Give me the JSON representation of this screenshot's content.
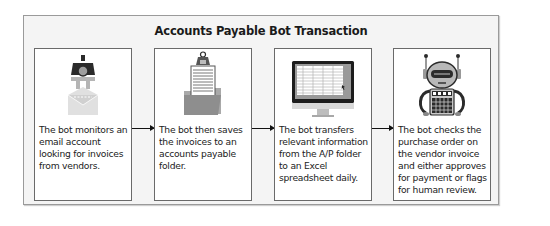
{
  "diagram": {
    "title": "Accounts Payable Bot Transaction",
    "steps": [
      {
        "icon": "robot-claw-envelope-icon",
        "text": "The bot monitors an email account looking for invoices from vendors."
      },
      {
        "icon": "clipboard-folder-icon",
        "text": "The bot then saves the invoices to an accounts payable folder."
      },
      {
        "icon": "monitor-spreadsheet-icon",
        "text": "The bot transfers relevant information from the A/P folder to an Excel spreadsheet daily."
      },
      {
        "icon": "robot-calculator-icon",
        "text": "The bot checks the purchase order on the vendor invoice and either approves for payment or flags for human review."
      }
    ],
    "connectors": [
      "step-1-to-step-2",
      "step-2-to-step-3",
      "step-3-to-step-4"
    ]
  },
  "colors": {
    "frame_bg": "#f4f4f4",
    "frame_border": "#9a9a9a",
    "box_border": "#6a6a6a",
    "icon_dark": "#2b2b2b",
    "icon_gray": "#9e9e9e",
    "icon_light": "#d6d6d6"
  }
}
